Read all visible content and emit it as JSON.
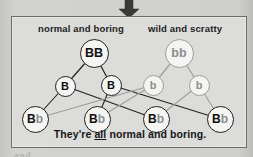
{
  "figure": {
    "type": "genetics-cross-diagram",
    "arrow_icon": "down-arrow-icon",
    "panel_border_color": "#6c6c6a",
    "panel_background_color": "#dcdcda",
    "dominant_color": "#101010",
    "recessive_color": "#8e8e8c"
  },
  "captions": {
    "left_parent_label": "normal and boring",
    "right_parent_label": "wild and scratty",
    "footer_prefix": "They're ",
    "footer_emphasis": "all",
    "footer_suffix": " normal and boring."
  },
  "parents": [
    {
      "id": "parent-left",
      "genotype": "BB",
      "alleles": [
        "B",
        "B"
      ],
      "style": "dominant",
      "cx": 93,
      "cy": 52
    },
    {
      "id": "parent-right",
      "genotype": "bb",
      "alleles": [
        "b",
        "b"
      ],
      "style": "recessive",
      "cx": 178,
      "cy": 52
    }
  ],
  "gametes": [
    {
      "id": "gamete-1",
      "allele": "B",
      "style": "dominant",
      "cx": 64,
      "cy": 85
    },
    {
      "id": "gamete-2",
      "allele": "B",
      "style": "dominant",
      "cx": 110,
      "cy": 84
    },
    {
      "id": "gamete-3",
      "allele": "b",
      "style": "recessive",
      "cx": 152,
      "cy": 84
    },
    {
      "id": "gamete-4",
      "allele": "b",
      "style": "recessive",
      "cx": 198,
      "cy": 84
    }
  ],
  "offspring": [
    {
      "id": "offspring-1",
      "genotype": "Bb",
      "dominant": "B",
      "recessive": "b",
      "cx": 34,
      "cy": 118
    },
    {
      "id": "offspring-2",
      "genotype": "Bb",
      "dominant": "B",
      "recessive": "b",
      "cx": 96,
      "cy": 118
    },
    {
      "id": "offspring-3",
      "genotype": "Bb",
      "dominant": "B",
      "recessive": "b",
      "cx": 155,
      "cy": 118
    },
    {
      "id": "offspring-4",
      "genotype": "Bb",
      "dominant": "B",
      "recessive": "b",
      "cx": 219,
      "cy": 118
    }
  ],
  "background_bleed": {
    "line_a": "AT IN",
    "line_b": "lotted",
    "line_c": "and"
  }
}
